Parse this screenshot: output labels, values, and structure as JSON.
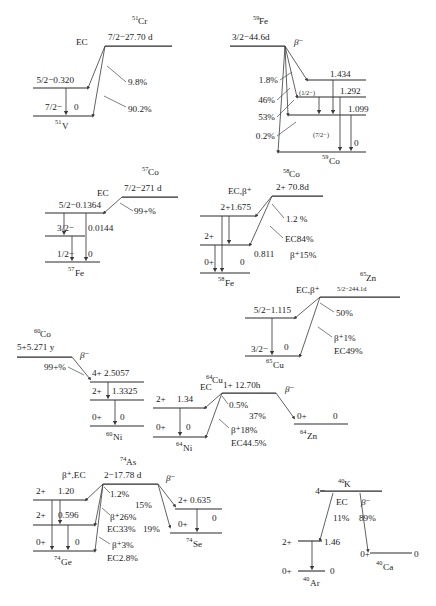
{
  "page": {
    "background": "#ffffff",
    "ink": "#1c1c1c"
  },
  "schemes": [
    {
      "id": "cr51",
      "parent": {
        "sup": "51",
        "element": "Cr",
        "spin_energy": "7/2−27.70 d"
      },
      "decay_mode": "EC",
      "daughter": {
        "sup": "51",
        "element": "V"
      },
      "levels": [
        {
          "spin": "5/2−",
          "energy": "0.320"
        },
        {
          "spin": "7/2−",
          "energy": "0"
        }
      ],
      "branches": [
        "9.8%",
        "90.2%"
      ]
    },
    {
      "id": "fe59",
      "parent": {
        "sup": "59",
        "element": "Fe",
        "spin_energy": "3/2−44.6d"
      },
      "decay_mode": "β⁻",
      "daughter": {
        "sup": "59",
        "element": "Co"
      },
      "levels": [
        {
          "spin": "",
          "energy": "1.434"
        },
        {
          "spin": "(1/2−)",
          "energy": "1.292"
        },
        {
          "spin": "",
          "energy": "1.099"
        },
        {
          "spin": "(7/2−)",
          "energy": "0"
        }
      ],
      "branches": [
        "1.8%",
        "46%",
        "53%",
        "0.2%"
      ]
    },
    {
      "id": "co57",
      "parent": {
        "sup": "57",
        "element": "Co",
        "spin_energy": "7/2−271 d"
      },
      "decay_mode": "EC",
      "daughter": {
        "sup": "57",
        "element": "Fe"
      },
      "levels": [
        {
          "spin": "5/2−",
          "energy": "0.1364"
        },
        {
          "spin": "3/2−",
          "energy": "0.0144"
        },
        {
          "spin": "1/2−",
          "energy": "0"
        }
      ],
      "branches": [
        "99+%"
      ]
    },
    {
      "id": "co58",
      "parent": {
        "sup": "58",
        "element": "Co",
        "spin_energy": "2+  70.8d"
      },
      "decay_mode": "EC,β⁺",
      "daughter": {
        "sup": "58",
        "element": "Fe"
      },
      "levels": [
        {
          "spin": "2+",
          "energy": "1.675"
        },
        {
          "spin": "2+",
          "energy": "0.811"
        },
        {
          "spin": "0+",
          "energy": "0"
        }
      ],
      "branches": [
        "1.2 %",
        "EC84%",
        "β⁺15%"
      ]
    },
    {
      "id": "zn65",
      "parent": {
        "sup": "65",
        "element": "Zn",
        "spin_energy": "5/2−244.1d"
      },
      "decay_mode": "EC,β⁺",
      "daughter": {
        "sup": "65",
        "element": "Cu"
      },
      "levels": [
        {
          "spin": "5/2−",
          "energy": "1.115"
        },
        {
          "spin": "3/2−",
          "energy": "0"
        }
      ],
      "branches": [
        "50%",
        "β⁺1%",
        "EC49%"
      ]
    },
    {
      "id": "co60",
      "parent": {
        "sup": "60",
        "element": "Co",
        "spin_energy": "5+5.271 y"
      },
      "decay_mode": "β⁻",
      "daughter": {
        "sup": "60",
        "element": "Ni"
      },
      "levels": [
        {
          "spin": "4+",
          "energy": "2.5057"
        },
        {
          "spin": "2+",
          "energy": "1.3325"
        },
        {
          "spin": "0+",
          "energy": "0"
        }
      ],
      "branches": [
        "99+%"
      ]
    },
    {
      "id": "cu64",
      "parent": {
        "sup": "64",
        "element": "Cu",
        "spin_energy": "1+ 12.70h"
      },
      "decay_mode_left": "EC",
      "decay_mode_right": "β⁻",
      "daughter_left": {
        "sup": "64",
        "element": "Ni"
      },
      "daughter_right": {
        "sup": "64",
        "element": "Zn"
      },
      "levels_left": [
        {
          "spin": "2+",
          "energy": "1.34"
        },
        {
          "spin": "0+",
          "energy": "0"
        }
      ],
      "levels_right": [
        {
          "spin": "0+",
          "energy": "0"
        }
      ],
      "branches": [
        "0.5%",
        "37%",
        "β⁺18%",
        "EC44.5%"
      ]
    },
    {
      "id": "as74",
      "parent": {
        "sup": "74",
        "element": "As",
        "spin_energy": "2−17.78 d"
      },
      "decay_mode_left": "β⁺,EC",
      "decay_mode_right": "β⁻",
      "daughter_left": {
        "sup": "74",
        "element": "Ge"
      },
      "daughter_right": {
        "sup": "74",
        "element": "Se"
      },
      "levels_left": [
        {
          "spin": "2+",
          "energy": "1.20"
        },
        {
          "spin": "2+",
          "energy": "0.596"
        },
        {
          "spin": "0+",
          "energy": "0"
        }
      ],
      "levels_right": [
        {
          "spin": "2+",
          "energy": "0.635"
        },
        {
          "spin": "0+",
          "energy": "0"
        }
      ],
      "branches": [
        "1.2%",
        "15%",
        "19%",
        "β⁺26%",
        "EC33%",
        "β⁺3%",
        "EC2.8%"
      ]
    },
    {
      "id": "k40",
      "parent": {
        "sup": "40",
        "element": "K",
        "spin_energy": "4−"
      },
      "decay_mode_left": "EC",
      "decay_mode_right": "β⁻",
      "daughter_left": {
        "sup": "40",
        "element": "Ar"
      },
      "daughter_right": {
        "sup": "40",
        "element": "Ca"
      },
      "levels_left": [
        {
          "spin": "2+",
          "energy": "1.46"
        },
        {
          "spin": "0+",
          "energy": "0"
        }
      ],
      "levels_right": [
        {
          "spin": "0+",
          "energy": "0"
        }
      ],
      "branches": [
        "11%",
        "89%"
      ]
    }
  ],
  "labels": {
    "cr51_sup": "51",
    "cr51_el": "Cr",
    "cr51_head": "7/2−27.70 d",
    "cr51_ec": "EC",
    "cr51_l1": "5/2−0.320",
    "cr51_l2s": "7/2−",
    "cr51_l2e": "0",
    "cr51_b1": "9.8%",
    "cr51_b2": "90.2%",
    "cr51_d_sup": "51",
    "cr51_d_el": "V",
    "fe59_sup": "59",
    "fe59_el": "Fe",
    "fe59_head": "3/2−44.6d",
    "fe59_beta": "β⁻",
    "fe59_e1": "1.434",
    "fe59_e2": "1.292",
    "fe59_e3": "1.099",
    "fe59_e4": "0",
    "fe59_s2": "(1/2−)",
    "fe59_s4": "(7/2−)",
    "fe59_b1": "1.8%",
    "fe59_b2": "46%",
    "fe59_b3": "53%",
    "fe59_b4": "0.2%",
    "fe59_d_sup": "59",
    "fe59_d_el": "Co",
    "co57_sup": "57",
    "co57_el": "Co",
    "co57_head": "7/2−271 d",
    "co57_ec": "EC",
    "co57_b1": "99+%",
    "co57_l1": "5/2−0.1364",
    "co57_l2s": "3/2−",
    "co57_l2e": "0.0144",
    "co57_l3s": "1/2−",
    "co57_l3e": "0",
    "co57_d_sup": "57",
    "co57_d_el": "Fe",
    "co58_sup": "58",
    "co58_el": "Co",
    "co58_head": "2+  70.8d",
    "co58_mode": "EC,β⁺",
    "co58_l1": "2+1.675",
    "co58_l2s": "2+",
    "co58_l2e": "0.811",
    "co58_l3s": "0+",
    "co58_l3e": "0",
    "co58_b1": "1.2 %",
    "co58_b2": "EC84%",
    "co58_b3": "β⁺15%",
    "co58_d_sup": "58",
    "co58_d_el": "Fe",
    "zn65_sup": "65",
    "zn65_el": "Zn",
    "zn65_mode": "EC,β⁺",
    "zn65_head": "5/2−244.1d",
    "zn65_l1": "5/2−1.115",
    "zn65_l2s": "3/2−",
    "zn65_l2e": "0",
    "zn65_b1": "50%",
    "zn65_b2": "β⁺1%",
    "zn65_b3": "EC49%",
    "zn65_d_sup": "65",
    "zn65_d_el": "Cu",
    "co60_sup": "60",
    "co60_el": "Co",
    "co60_head": "5+5.271 y",
    "co60_beta": "β⁻",
    "co60_b1": "99+%",
    "co60_l1": "4+ 2.5057",
    "co60_l2s": "2+",
    "co60_l2e": "1.3325",
    "co60_l3s": "0+",
    "co60_l3e": "0",
    "co60_d_sup": "60",
    "co60_d_el": "Ni",
    "cu64_sup": "64",
    "cu64_el": "Cu",
    "cu64_head": "1+ 12.70h",
    "cu64_ec": "EC",
    "cu64_beta": "β⁻",
    "cu64_l1s": "2+",
    "cu64_l1e": "1.34",
    "cu64_l2s": "0+",
    "cu64_l2e": "0",
    "cu64_r1s": "0+",
    "cu64_r1e": "0",
    "cu64_b1": "0.5%",
    "cu64_b2": "37%",
    "cu64_b3": "β⁺18%",
    "cu64_b4": "EC44.5%",
    "cu64_dl_sup": "64",
    "cu64_dl_el": "Ni",
    "cu64_dr_sup": "64",
    "cu64_dr_el": "Zn",
    "as74_sup": "74",
    "as74_el": "As",
    "as74_head": "2−17.78 d",
    "as74_modeL": "β⁺,EC",
    "as74_modeR": "β⁻",
    "as74_l1s": "2+",
    "as74_l1e": "1.20",
    "as74_l2s": "2+",
    "as74_l2e": "0.596",
    "as74_l3s": "0+",
    "as74_l3e": "0",
    "as74_r1": "2+ 0.635",
    "as74_r2s": "0+",
    "as74_r2e": "0",
    "as74_b1": "1.2%",
    "as74_b2": "15%",
    "as74_b3": "19%",
    "as74_b4": "β⁺26%",
    "as74_b5": "EC33%",
    "as74_b6": "β⁺3%",
    "as74_b7": "EC2.8%",
    "as74_dl_sup": "74",
    "as74_dl_el": "Ge",
    "as74_dr_sup": "74",
    "as74_dr_el": "Se",
    "k40_sup": "40",
    "k40_el": "K",
    "k40_head": "4−",
    "k40_ec": "EC",
    "k40_beta": "β⁻",
    "k40_b1": "11%",
    "k40_b2": "89%",
    "k40_l1s": "2+",
    "k40_l1e": "1.46",
    "k40_l2s": "0+",
    "k40_l2e": "0",
    "k40_r1s": "0+",
    "k40_r1e": "0",
    "k40_dl_sup": "40",
    "k40_dl_el": "Ar",
    "k40_dr_sup": "40",
    "k40_dr_el": "Ca"
  }
}
